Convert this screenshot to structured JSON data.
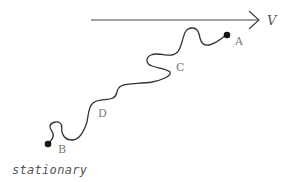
{
  "diagram": {
    "type": "path-diagram",
    "velocity_arrow": {
      "label": "V",
      "direction": "right"
    },
    "points": [
      {
        "id": "A",
        "label": "A",
        "marker": "filled-dot"
      },
      {
        "id": "C",
        "label": "C",
        "marker": "none"
      },
      {
        "id": "D",
        "label": "D",
        "marker": "none"
      },
      {
        "id": "B",
        "label": "B",
        "marker": "filled-dot"
      }
    ],
    "caption": "stationary",
    "colors": {
      "line": "#333333",
      "label": "#777777",
      "background": "#ffffff"
    }
  }
}
